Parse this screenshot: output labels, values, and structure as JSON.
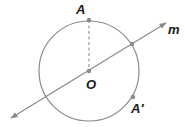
{
  "diagram": {
    "colors": {
      "stroke": "#8a8a8a",
      "point": "#8a8a8a",
      "label": "#1a1a1a",
      "background": "#ffffff"
    },
    "circle": {
      "center": [
        89,
        71
      ],
      "radius": 50
    },
    "line_m": {
      "from": [
        11,
        118
      ],
      "to": [
        166,
        23
      ],
      "label": "m"
    },
    "segment_AO": {
      "from": [
        89,
        20
      ],
      "to": [
        89,
        71
      ],
      "style": "dashed"
    },
    "points": [
      {
        "id": "A",
        "label": "A",
        "pos": [
          89,
          20
        ],
        "label_pos": [
          76,
          14
        ]
      },
      {
        "id": "O",
        "label": "O",
        "pos": [
          89,
          71
        ],
        "label_pos": [
          90,
          88
        ]
      },
      {
        "id": "P",
        "label": "",
        "pos": [
          132,
          44
        ],
        "label_pos": [
          0,
          0
        ]
      },
      {
        "id": "A_prime",
        "label": "A′",
        "pos": [
          133,
          97
        ],
        "label_pos": [
          132,
          113
        ]
      }
    ]
  }
}
